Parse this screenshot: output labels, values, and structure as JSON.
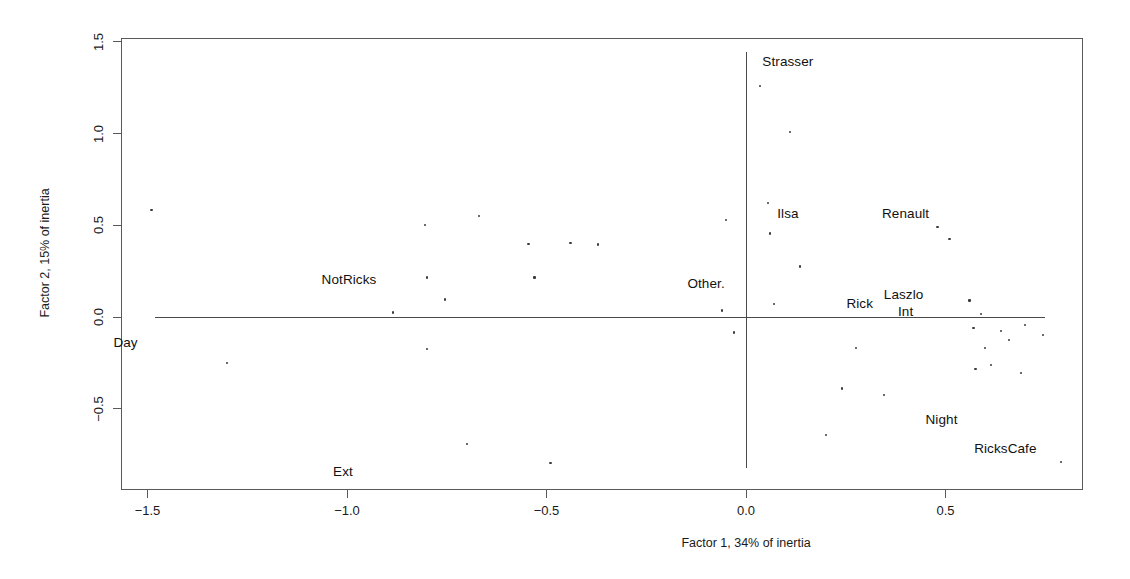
{
  "chart_data": {
    "type": "scatter",
    "title": "",
    "xlabel": "Factor 1, 34% of inertia",
    "ylabel": "Factor 2, 15% of inertia",
    "xlim": [
      -1.63,
      0.84
    ],
    "ylim": [
      -0.96,
      1.51
    ],
    "xticks": [
      -1.5,
      -1.0,
      -0.5,
      0.0,
      0.5
    ],
    "xticklabels": [
      "−1.5",
      "−1.0",
      "−0.5",
      "0.0",
      "0.5"
    ],
    "yticks": [
      -0.5,
      0.0,
      0.5,
      1.0,
      1.5
    ],
    "yticklabels": [
      "−0.5",
      "0.0",
      "0.5",
      "1.0",
      "1.5"
    ],
    "grid": false,
    "legend": "none",
    "reference_lines": {
      "horizontal_at": 0.0,
      "vertical_at": 0.0
    },
    "annotations": [
      {
        "text": "Strasser",
        "x": 0.105,
        "y": 1.395
      },
      {
        "text": "Ilsa",
        "x": 0.105,
        "y": 0.565
      },
      {
        "text": "Renault",
        "x": 0.4,
        "y": 0.565
      },
      {
        "text": "Other.",
        "x": -0.1,
        "y": 0.185
      },
      {
        "text": "Rick",
        "x": 0.285,
        "y": 0.075
      },
      {
        "text": "Laszlo",
        "x": 0.395,
        "y": 0.125
      },
      {
        "text": "Int",
        "x": 0.4,
        "y": 0.03
      },
      {
        "text": "NotRicks",
        "x": -0.995,
        "y": 0.205
      },
      {
        "text": "Day",
        "x": -1.555,
        "y": -0.135
      },
      {
        "text": "Night",
        "x": 0.49,
        "y": -0.555
      },
      {
        "text": "RicksCafe",
        "x": 0.65,
        "y": -0.715
      },
      {
        "text": "Ext",
        "x": -1.01,
        "y": -0.84
      }
    ],
    "points": [
      {
        "x": -1.49,
        "y": 0.585
      },
      {
        "x": -1.3,
        "y": -0.25
      },
      {
        "x": -0.885,
        "y": 0.025
      },
      {
        "x": -0.805,
        "y": 0.5
      },
      {
        "x": -0.8,
        "y": 0.215
      },
      {
        "x": -0.8,
        "y": -0.175
      },
      {
        "x": -0.755,
        "y": 0.095
      },
      {
        "x": -0.7,
        "y": -0.69
      },
      {
        "x": -0.67,
        "y": 0.55
      },
      {
        "x": -0.545,
        "y": 0.4
      },
      {
        "x": -0.53,
        "y": 0.215
      },
      {
        "x": -0.49,
        "y": -0.795
      },
      {
        "x": -0.44,
        "y": 0.405
      },
      {
        "x": -0.37,
        "y": 0.395
      },
      {
        "x": -0.05,
        "y": 0.53
      },
      {
        "x": -0.06,
        "y": 0.035
      },
      {
        "x": -0.03,
        "y": -0.085
      },
      {
        "x": 0.035,
        "y": 1.26
      },
      {
        "x": 0.055,
        "y": 0.62
      },
      {
        "x": 0.06,
        "y": 0.455
      },
      {
        "x": 0.07,
        "y": 0.07
      },
      {
        "x": 0.11,
        "y": 1.01
      },
      {
        "x": 0.135,
        "y": 0.275
      },
      {
        "x": 0.2,
        "y": -0.645
      },
      {
        "x": 0.24,
        "y": -0.39
      },
      {
        "x": 0.275,
        "y": -0.17
      },
      {
        "x": 0.345,
        "y": -0.425
      },
      {
        "x": 0.48,
        "y": 0.49
      },
      {
        "x": 0.51,
        "y": 0.425
      },
      {
        "x": 0.56,
        "y": 0.09
      },
      {
        "x": 0.57,
        "y": -0.06
      },
      {
        "x": 0.575,
        "y": -0.285
      },
      {
        "x": 0.59,
        "y": 0.015
      },
      {
        "x": 0.6,
        "y": -0.17
      },
      {
        "x": 0.615,
        "y": -0.26
      },
      {
        "x": 0.64,
        "y": -0.075
      },
      {
        "x": 0.66,
        "y": -0.125
      },
      {
        "x": 0.69,
        "y": -0.305
      },
      {
        "x": 0.7,
        "y": -0.045
      },
      {
        "x": 0.745,
        "y": -0.1
      },
      {
        "x": 0.79,
        "y": -0.79
      }
    ]
  }
}
